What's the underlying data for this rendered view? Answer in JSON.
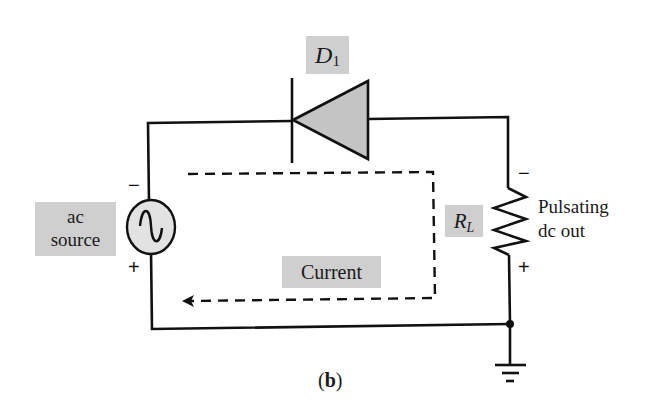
{
  "figure": {
    "caption_open": "(",
    "caption_letter": "b",
    "caption_close": ")"
  },
  "labels": {
    "diode_name": "D",
    "diode_sub": "1",
    "source_line1": "ac",
    "source_line2": "source",
    "resistor_name": "R",
    "resistor_sub": "L",
    "current": "Current",
    "output_line1": "Pulsating",
    "output_line2": "dc out"
  },
  "polarity": {
    "source_top": "−",
    "source_bottom": "+",
    "load_top": "−",
    "load_bottom": "+"
  },
  "colors": {
    "wire": "#111111",
    "label_bg": "#cfcfcf",
    "diode_fill": "#c4c4c4"
  }
}
